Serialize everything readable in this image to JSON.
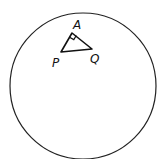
{
  "diagram": {
    "circle": {
      "cx": 83,
      "cy": 86,
      "r": 73,
      "stroke": "#222222"
    },
    "triangle": {
      "vertices": {
        "A": {
          "x": 72,
          "y": 33
        },
        "P": {
          "x": 61,
          "y": 52
        },
        "Q": {
          "x": 92,
          "y": 49
        }
      },
      "right_angle_at": "A"
    },
    "labels": {
      "A": "A",
      "P": "P",
      "Q": "Q"
    }
  }
}
